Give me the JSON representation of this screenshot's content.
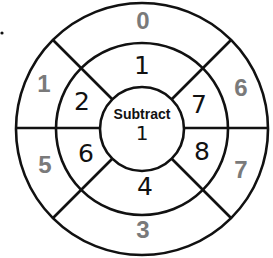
{
  "diagram": {
    "type": "math-wheel",
    "center": {
      "operation": "Subtract",
      "value": "1"
    },
    "middle_ring": [
      {
        "position": "top",
        "value": "1"
      },
      {
        "position": "upper-right",
        "value": "7"
      },
      {
        "position": "lower-right",
        "value": "8"
      },
      {
        "position": "bottom",
        "value": "4"
      },
      {
        "position": "lower-left",
        "value": "6"
      },
      {
        "position": "upper-left",
        "value": "2"
      }
    ],
    "outer_ring": [
      {
        "position": "top",
        "value": "0"
      },
      {
        "position": "upper-right",
        "value": "6"
      },
      {
        "position": "lower-right",
        "value": "7"
      },
      {
        "position": "bottom",
        "value": "3"
      },
      {
        "position": "lower-left",
        "value": "5"
      },
      {
        "position": "upper-left",
        "value": "1"
      }
    ],
    "colors": {
      "lines": "#111111",
      "outer_numbers": "#7a7a7a",
      "middle_numbers": "#111111"
    }
  }
}
